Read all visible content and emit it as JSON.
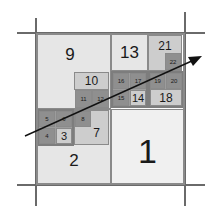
{
  "diagram": {
    "cells": [
      {
        "id": "1",
        "label": "1"
      },
      {
        "id": "2",
        "label": "2"
      },
      {
        "id": "3",
        "label": "3"
      },
      {
        "id": "4",
        "label": "4"
      },
      {
        "id": "5",
        "label": "5"
      },
      {
        "id": "6",
        "label": "6"
      },
      {
        "id": "7",
        "label": "7"
      },
      {
        "id": "8",
        "label": "8"
      },
      {
        "id": "9",
        "label": "9"
      },
      {
        "id": "10",
        "label": "10"
      },
      {
        "id": "11",
        "label": "11"
      },
      {
        "id": "12",
        "label": "12"
      },
      {
        "id": "13",
        "label": "13"
      },
      {
        "id": "14",
        "label": "14"
      },
      {
        "id": "15",
        "label": "15"
      },
      {
        "id": "16",
        "label": "16"
      },
      {
        "id": "17",
        "label": "17"
      },
      {
        "id": "18",
        "label": "18"
      },
      {
        "id": "19",
        "label": "19"
      },
      {
        "id": "20",
        "label": "20"
      },
      {
        "id": "21",
        "label": "21"
      },
      {
        "id": "22",
        "label": "22"
      }
    ],
    "labels": {
      "c1": "1",
      "c2": "2",
      "c3": "3",
      "c4": "4",
      "c5": "5",
      "c6": "6",
      "c7": "7",
      "c8": "8",
      "c9": "9",
      "c10": "10",
      "c11": "11",
      "c12": "12",
      "c13": "13",
      "c14": "14",
      "c15": "15",
      "c16": "16",
      "c17": "17",
      "c18": "18",
      "c19": "19",
      "c20": "20",
      "c21": "21",
      "c22": "22"
    },
    "arrow": {
      "from": [
        25,
        136
      ],
      "to": [
        202,
        56
      ]
    },
    "colors": {
      "line": "#6a6a6a",
      "arrow": "#111111"
    }
  }
}
